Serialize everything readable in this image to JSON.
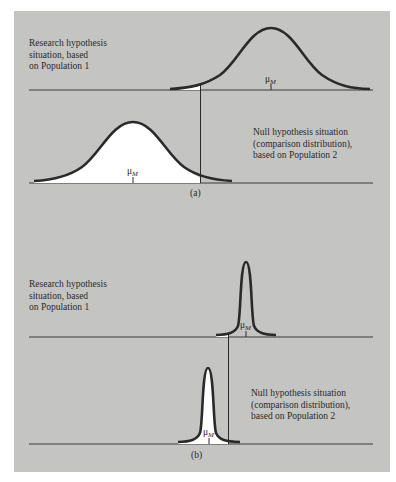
{
  "figure": {
    "panel_color": "#c4c4c2",
    "curve_color": "#2a2a2a",
    "fill_color": "#ffffff",
    "part_a": {
      "caption": "(a)",
      "research": {
        "label_lines": [
          "Research hypothesis",
          "situation, based",
          "on Population 1"
        ],
        "mean_label": "μ",
        "mean_subscript": "M"
      },
      "null": {
        "label_lines": [
          "Null hypothesis situation",
          "(comparison distribution),",
          "based on Population 2"
        ],
        "mean_label": "μ",
        "mean_subscript": "M"
      }
    },
    "part_b": {
      "caption": "(b)",
      "research": {
        "label_lines": [
          "Research hypothesis",
          "situation, based",
          "on Population 1"
        ],
        "mean_label": "μ",
        "mean_subscript": "M"
      },
      "null": {
        "label_lines": [
          "Null hypothesis situation",
          "(comparison distribution),",
          "based on Population 2"
        ],
        "mean_label": "μ",
        "mean_subscript": "M"
      }
    }
  }
}
